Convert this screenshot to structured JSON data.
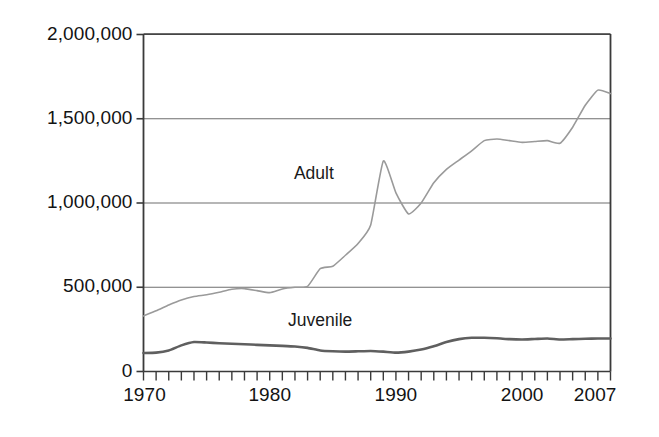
{
  "chart_data": {
    "type": "line",
    "title": "",
    "xlabel": "",
    "ylabel": "",
    "xlim": [
      1970,
      2007
    ],
    "ylim": [
      0,
      2000000
    ],
    "grid": true,
    "legend_position": "inline-labels",
    "y_ticks": [
      0,
      500000,
      1000000,
      1500000,
      2000000
    ],
    "y_tick_labels": [
      "0",
      "500,000",
      "1,000,000",
      "1,500,000",
      "2,000,000"
    ],
    "x_ticks": [
      1970,
      1980,
      1990,
      2000,
      2007
    ],
    "x_tick_labels": [
      "1970",
      "1980",
      "1990",
      "2000",
      "2007"
    ],
    "x_minor_tick_interval": 1,
    "x": [
      1970,
      1971,
      1972,
      1973,
      1974,
      1975,
      1976,
      1977,
      1978,
      1979,
      1980,
      1981,
      1982,
      1983,
      1984,
      1985,
      1986,
      1987,
      1988,
      1989,
      1990,
      1991,
      1992,
      1993,
      1994,
      1995,
      1996,
      1997,
      1998,
      1999,
      2000,
      2001,
      2002,
      2003,
      2004,
      2005,
      2006,
      2007
    ],
    "series": [
      {
        "name": "Adult",
        "color": "#9a9a9a",
        "line_width": 1.6,
        "values": [
          330000,
          360000,
          395000,
          425000,
          445000,
          455000,
          470000,
          488000,
          492000,
          480000,
          468000,
          490000,
          500000,
          505000,
          610000,
          625000,
          690000,
          760000,
          870000,
          1250000,
          1060000,
          935000,
          1000000,
          1120000,
          1200000,
          1255000,
          1310000,
          1370000,
          1380000,
          1370000,
          1360000,
          1365000,
          1370000,
          1355000,
          1450000,
          1580000,
          1670000,
          1650000
        ]
      },
      {
        "name": "Juvenile",
        "color": "#5f5f5f",
        "line_width": 2.6,
        "values": [
          110000,
          112000,
          125000,
          155000,
          175000,
          172000,
          168000,
          165000,
          162000,
          158000,
          155000,
          152000,
          148000,
          140000,
          125000,
          120000,
          118000,
          120000,
          122000,
          118000,
          112000,
          118000,
          130000,
          150000,
          175000,
          192000,
          200000,
          200000,
          197000,
          192000,
          190000,
          193000,
          196000,
          190000,
          192000,
          194000,
          196000,
          196000
        ]
      }
    ],
    "annotations": [
      {
        "name": "Adult",
        "text": "Adult",
        "x": 1983.5,
        "y": 1170000
      },
      {
        "name": "Juvenile",
        "text": "Juvenile",
        "x": 1984.0,
        "y": 300000
      }
    ]
  },
  "axis": {
    "axis_color": "#3a3a3a",
    "grid_color": "#6e6e6e"
  }
}
